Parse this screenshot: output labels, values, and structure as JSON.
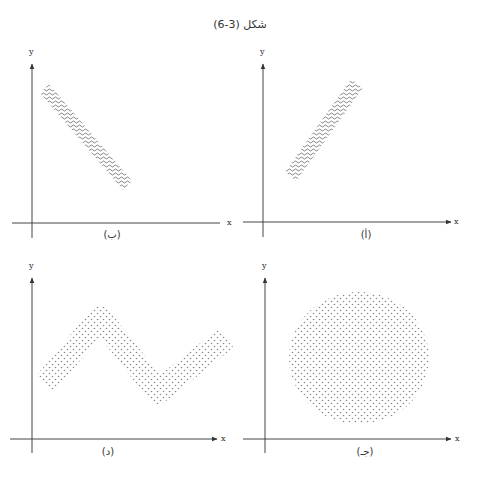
{
  "figure": {
    "title": "شكل (3-6)"
  },
  "colors": {
    "axis": "#444444",
    "pattern": "#777777",
    "background": "#ffffff"
  },
  "panels": [
    {
      "id": "b",
      "label": "(ب)",
      "x_axis_label": "x",
      "y_axis_label": "y",
      "shape": "descending-band",
      "pattern": "wavy"
    },
    {
      "id": "a",
      "label": "(أ)",
      "x_axis_label": "x",
      "y_axis_label": "y",
      "shape": "ascending-band",
      "pattern": "wavy"
    },
    {
      "id": "d",
      "label": "(د)",
      "x_axis_label": "x",
      "y_axis_label": "y",
      "shape": "curved-band",
      "pattern": "dotted"
    },
    {
      "id": "c",
      "label": "(جـ)",
      "x_axis_label": "x",
      "y_axis_label": "y",
      "shape": "circle",
      "pattern": "dotted"
    }
  ]
}
